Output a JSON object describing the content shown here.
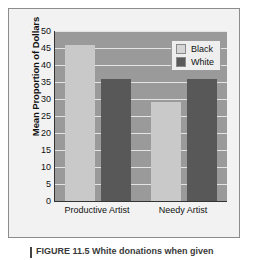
{
  "chart_data": {
    "type": "bar",
    "title": "",
    "xlabel": "",
    "ylabel": "Mean Proportion of Dollars",
    "ylim": [
      0,
      50
    ],
    "ytick_step": 5,
    "yticks": [
      "50",
      "45",
      "40",
      "35",
      "30",
      "25",
      "20",
      "15",
      "10",
      "5",
      "0"
    ],
    "ytick_values": [
      50,
      45,
      40,
      35,
      30,
      25,
      20,
      15,
      10,
      5,
      0
    ],
    "categories": [
      "Productive Artist",
      "Needy Artist"
    ],
    "series": [
      {
        "name": "Black",
        "values": [
          46,
          29
        ],
        "color": "#c9c9c9"
      },
      {
        "name": "White",
        "values": [
          36,
          36
        ],
        "color": "#585858"
      }
    ],
    "grid": true,
    "grid_color": "#e4e4e4",
    "legend_position": "top-right",
    "plot_background": "#9a9a9a",
    "figure_background": "#f2f2f2"
  },
  "legend": {
    "entries": [
      {
        "label": "Black",
        "swatch": "black-swatch"
      },
      {
        "label": "White",
        "swatch": "white-swatch"
      }
    ]
  },
  "caption": {
    "text": "FIGURE 11.5  White donations when given"
  }
}
